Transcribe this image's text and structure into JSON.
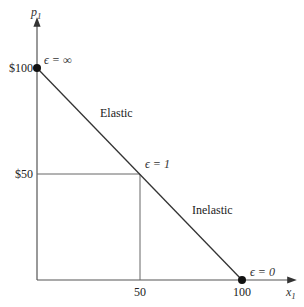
{
  "diagram": {
    "y_axis": {
      "label": "p",
      "subscript": "1"
    },
    "x_axis": {
      "label": "x",
      "subscript": "1"
    },
    "y_ticks": [
      {
        "label": "$100",
        "value": 100
      },
      {
        "label": "$50",
        "value": 50
      }
    ],
    "x_ticks": [
      {
        "label": "50",
        "value": 50
      },
      {
        "label": "100",
        "value": 100
      }
    ],
    "regions": {
      "elastic": "Elastic",
      "inelastic": "Inelastic"
    },
    "points": [
      {
        "name": "top",
        "label": "ϵ = ∞",
        "x": 0,
        "y": 100
      },
      {
        "name": "mid",
        "label": "ϵ = 1",
        "x": 50,
        "y": 50
      },
      {
        "name": "bottom",
        "label": "ϵ = 0",
        "x": 100,
        "y": 0
      }
    ],
    "colors": {
      "line": "#333333",
      "axis": "#555555",
      "guide": "#666666",
      "dot": "#111111"
    }
  }
}
